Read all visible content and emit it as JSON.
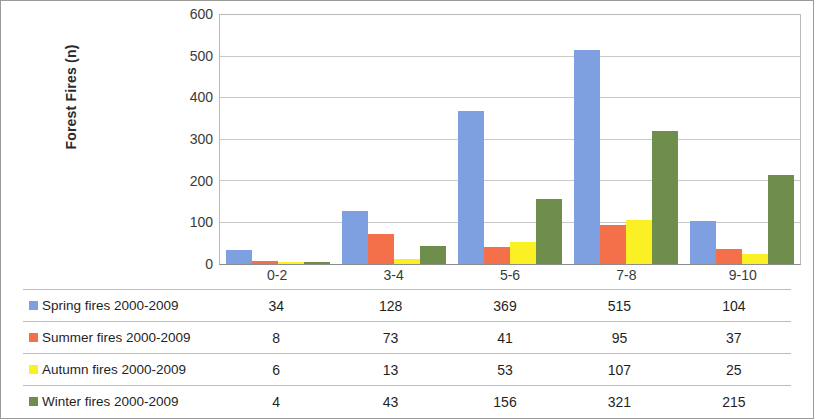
{
  "chart_data": {
    "type": "bar",
    "title": "",
    "xlabel": "",
    "ylabel": "Forest Fires  (n)",
    "ylim": [
      0,
      600
    ],
    "y_ticks": [
      0,
      100,
      200,
      300,
      400,
      500,
      600
    ],
    "grid": true,
    "legend_position": "table-below",
    "categories": [
      "0-2",
      "3-4",
      "5-6",
      "7-8",
      "9-10"
    ],
    "series": [
      {
        "name": "Spring fires  2000-2009",
        "color": "#7E9FE0",
        "values": [
          34,
          128,
          369,
          515,
          104
        ]
      },
      {
        "name": "Summer fires  2000-2009",
        "color": "#F4704A",
        "values": [
          8,
          73,
          41,
          95,
          37
        ]
      },
      {
        "name": "Autumn fires  2000-2009",
        "color": "#FBF024",
        "values": [
          6,
          13,
          53,
          107,
          25
        ]
      },
      {
        "name": "Winter fires  2000-2009",
        "color": "#6F8D4B",
        "values": [
          4,
          43,
          156,
          321,
          215
        ]
      }
    ]
  },
  "axis": {
    "y_title": "Forest Fires  (n)",
    "y_tick_labels": [
      "600",
      "500",
      "400",
      "300",
      "200",
      "100",
      "0"
    ],
    "x_tick_labels": [
      "0-2",
      "3-4",
      "5-6",
      "7-8",
      "9-10"
    ]
  },
  "table": {
    "rows": [
      {
        "label": "Spring fires  2000-2009",
        "color": "#7E9FE0",
        "values": [
          "34",
          "128",
          "369",
          "515",
          "104"
        ]
      },
      {
        "label": "Summer fires  2000-2009",
        "color": "#F4704A",
        "values": [
          "8",
          "73",
          "41",
          "95",
          "37"
        ]
      },
      {
        "label": "Autumn fires  2000-2009",
        "color": "#FBF024",
        "values": [
          "6",
          "13",
          "53",
          "107",
          "25"
        ]
      },
      {
        "label": "Winter fires  2000-2009",
        "color": "#6F8D4B",
        "values": [
          "4",
          "43",
          "156",
          "321",
          "215"
        ]
      }
    ]
  }
}
